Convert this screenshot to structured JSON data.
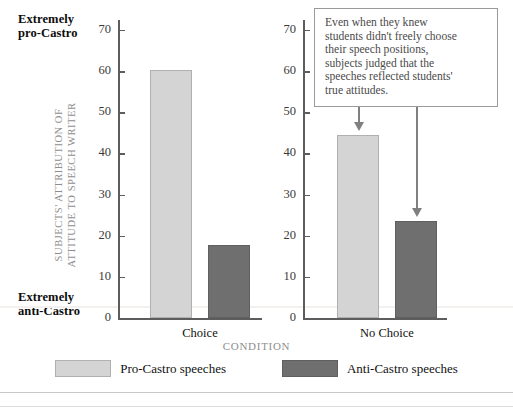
{
  "chart_data": {
    "type": "bar",
    "title": "",
    "xlabel": "CONDITION",
    "ylabel": "SUBJECTS' ATTRIBUTION OF ATTITUDE TO SPEECH WRITER",
    "ylabel_lines": [
      "SUBJECTS' ATTRIBUTION OF",
      "ATTITUDE TO SPEECH WRITER"
    ],
    "categories": [
      "Choice",
      "No Choice"
    ],
    "series": [
      {
        "name": "Pro-Castro speeches",
        "values": [
          60.2,
          44.5
        ],
        "color": "#d4d4d4"
      },
      {
        "name": "Anti-Castro speeches",
        "values": [
          17.7,
          23.5
        ],
        "color": "#6f6f6f"
      }
    ],
    "ylim": [
      0,
      73
    ],
    "yticks": [
      0,
      10,
      20,
      30,
      40,
      50,
      60,
      70
    ],
    "ytick_labels": [
      "0",
      "10",
      "20",
      "30",
      "40",
      "50",
      "60",
      "70"
    ],
    "grid": false,
    "legend_position": "bottom-center",
    "axis_endpoint_labels": {
      "top": [
        "Extremely",
        "pro-Castro"
      ],
      "bottom": [
        "Extremely",
        "anti-Castro"
      ]
    },
    "annotation": {
      "text": "Even when they knew students didn't freely choose their speech positions, subjects judged that the speeches reflected students' true attitudes.",
      "lines": [
        "Even when they knew",
        "students didn't freely choose",
        "their speech positions,",
        "subjects judged that the",
        "speeches reflected students'",
        "true attitudes."
      ],
      "points_to": [
        "No Choice / Pro-Castro speeches",
        "No Choice / Anti-Castro speeches"
      ]
    }
  },
  "colors": {
    "pro_castro": "#d4d4d4",
    "anti_castro": "#6f6f6f",
    "axis": "#5d5d5d",
    "axis_title": "#8e8e8e",
    "annotation_text": "#4a4a4a",
    "arrow": "#808080"
  }
}
